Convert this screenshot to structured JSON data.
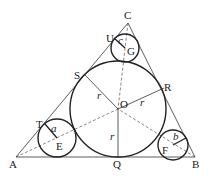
{
  "diagram": {
    "points": {
      "A": {
        "label": "A",
        "x": 16,
        "y": 157
      },
      "B": {
        "label": "B",
        "x": 195,
        "y": 157
      },
      "C": {
        "label": "C",
        "x": 128,
        "y": 23
      },
      "O": {
        "label": "O",
        "x": 118,
        "y": 109
      },
      "Q": {
        "label": "Q",
        "x": 118,
        "y": 157
      },
      "S": {
        "label": "S",
        "x": 85,
        "y": 75
      },
      "R": {
        "label": "R",
        "x": 164,
        "y": 88
      },
      "E": {
        "label": "E",
        "x": 57,
        "y": 138
      },
      "F": {
        "label": "F",
        "x": 173,
        "y": 145
      },
      "G": {
        "label": "G",
        "x": 125,
        "y": 48
      },
      "T": {
        "label": "T",
        "x": 45,
        "y": 124
      },
      "U": {
        "label": "U",
        "x": 114,
        "y": 38
      }
    },
    "radii": {
      "r": "r",
      "a": "a",
      "b": "b",
      "c": "c"
    },
    "colors": {
      "stroke": "#222222",
      "dashed": "#555555"
    }
  }
}
